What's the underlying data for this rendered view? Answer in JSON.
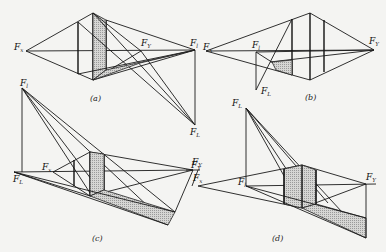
{
  "figure": {
    "shade_color": "#c9c9c9",
    "line_color": "#1a1a1a",
    "background": "#f4f4f2"
  },
  "panels": [
    {
      "id": "a",
      "caption": "(a)",
      "labels": [
        {
          "text": "F",
          "sub": "x",
          "x": 14,
          "y": 50
        },
        {
          "text": "F",
          "sub": "Y",
          "x": 141,
          "y": 46
        },
        {
          "text": "F",
          "sub": "l",
          "x": 192,
          "y": 46
        },
        {
          "text": "F",
          "sub": "L",
          "x": 192,
          "y": 130
        }
      ]
    },
    {
      "id": "b",
      "caption": "(b)",
      "labels": [
        {
          "text": "F",
          "sub": "x",
          "x": 203,
          "y": 50
        },
        {
          "text": "F",
          "sub": "l",
          "x": 252,
          "y": 47
        },
        {
          "text": "F",
          "sub": "L",
          "x": 262,
          "y": 94
        },
        {
          "text": "F",
          "sub": "Y",
          "x": 370,
          "y": 43
        }
      ]
    },
    {
      "id": "c",
      "caption": "(c)",
      "labels": [
        {
          "text": "F",
          "sub": "l",
          "x": 21,
          "y": 86
        },
        {
          "text": "F",
          "sub": "x",
          "x": 42,
          "y": 172
        },
        {
          "text": "F",
          "sub": "L",
          "x": 13,
          "y": 181
        },
        {
          "text": "F",
          "sub": "Y",
          "x": 192,
          "y": 169
        }
      ]
    },
    {
      "id": "d",
      "caption": "(d)",
      "labels": [
        {
          "text": "F",
          "sub": "L",
          "x": 233,
          "y": 106
        },
        {
          "text": "F",
          "sub": "Y",
          "x": 192,
          "y": 164
        },
        {
          "text": "F",
          "sub": "x",
          "x": 193,
          "y": 181
        },
        {
          "text": "F",
          "sub": "l",
          "x": 238,
          "y": 185
        },
        {
          "text": "F",
          "sub": "Y",
          "x": 367,
          "y": 180
        }
      ]
    }
  ]
}
